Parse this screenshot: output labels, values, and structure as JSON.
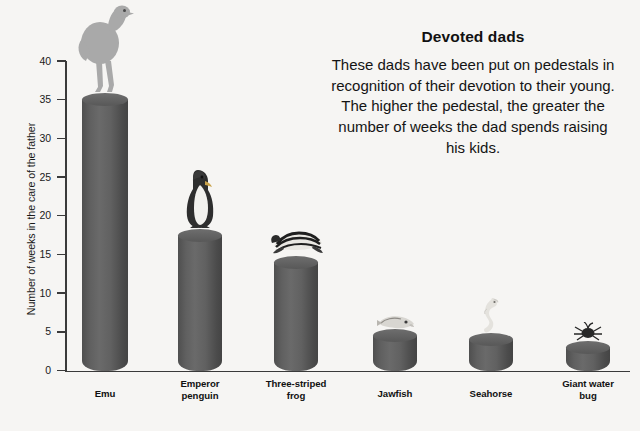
{
  "panel": {
    "title": "Devoted dads",
    "body": "These dads have been put on pedestals in recognition of their devotion to their young. The higher the pedestal, the greater the number of weeks the dad spends raising his kids."
  },
  "chart_data": {
    "type": "bar",
    "title": "Devoted dads",
    "xlabel": "",
    "ylabel": "Number of weeks in the care of the father",
    "ylim": [
      0,
      40
    ],
    "yticks": [
      0,
      5,
      10,
      15,
      20,
      25,
      30,
      35,
      40
    ],
    "grid": false,
    "legend": "none",
    "categories": [
      "Emu",
      "Emperor penguin",
      "Three-striped frog",
      "Jawfish",
      "Seahorse",
      "Giant water bug"
    ],
    "values": [
      35,
      17.5,
      14,
      4.5,
      4,
      3
    ],
    "bar_style": "3d-cylinder-pedestal",
    "colors": {
      "background": "#f6f5f3",
      "bar": "#5d5d5d",
      "axis": "#3a3a3a",
      "text": "#141414"
    }
  },
  "axis": {
    "tick_labels": [
      "40",
      "35",
      "30",
      "25",
      "20",
      "15",
      "10",
      "5",
      "0"
    ],
    "y_title": "Number of weeks in the care of the father"
  },
  "bars": [
    {
      "label_line1": "Emu",
      "label_line2": "",
      "value": 35,
      "icon": "emu-icon"
    },
    {
      "label_line1": "Emperor",
      "label_line2": "penguin",
      "value": 17.5,
      "icon": "emperor-penguin-icon"
    },
    {
      "label_line1": "Three-striped",
      "label_line2": "frog",
      "value": 14,
      "icon": "three-striped-frog-icon"
    },
    {
      "label_line1": "Jawfish",
      "label_line2": "",
      "value": 4.5,
      "icon": "jawfish-icon"
    },
    {
      "label_line1": "Seahorse",
      "label_line2": "",
      "value": 4,
      "icon": "seahorse-icon"
    },
    {
      "label_line1": "Giant water",
      "label_line2": "bug",
      "value": 3,
      "icon": "giant-water-bug-icon"
    }
  ]
}
